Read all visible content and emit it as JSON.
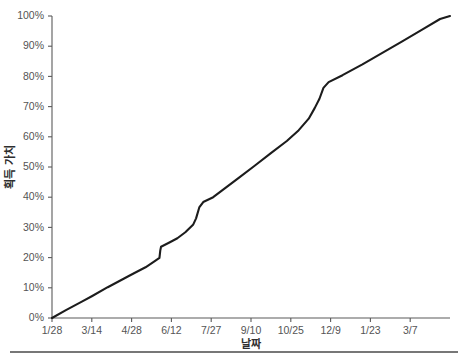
{
  "chart_data": {
    "type": "line",
    "title": "",
    "xlabel": "날짜",
    "ylabel": "획득 가치",
    "grid": false,
    "legend": false,
    "legend_position": "none",
    "line_color": "#1c1c1c",
    "axis_color": "#5a5a5a",
    "background": "#ffffff",
    "xlim": [
      0,
      10
    ],
    "ylim": [
      0,
      100
    ],
    "x_tick_positions": [
      0,
      1,
      2,
      3,
      4,
      5,
      6,
      7,
      8,
      9
    ],
    "categories": [
      "1/28",
      "3/14",
      "4/28",
      "6/12",
      "7/27",
      "9/10",
      "10/25",
      "12/9",
      "1/23",
      "3/7"
    ],
    "y_tick_values": [
      0,
      10,
      20,
      30,
      40,
      50,
      60,
      70,
      80,
      90,
      100
    ],
    "y_tick_labels": [
      "0%",
      "10%",
      "20%",
      "30%",
      "40%",
      "50%",
      "60%",
      "70%",
      "80%",
      "90%",
      "100%"
    ],
    "series": [
      {
        "name": "획득 가치",
        "points": [
          {
            "x": 0.0,
            "y": 0.0
          },
          {
            "x": 0.35,
            "y": 2.6
          },
          {
            "x": 0.75,
            "y": 5.4
          },
          {
            "x": 1.0,
            "y": 7.2
          },
          {
            "x": 1.4,
            "y": 10.2
          },
          {
            "x": 1.8,
            "y": 13.0
          },
          {
            "x": 2.0,
            "y": 14.4
          },
          {
            "x": 2.35,
            "y": 16.8
          },
          {
            "x": 2.6,
            "y": 19.0
          },
          {
            "x": 2.7,
            "y": 19.9
          },
          {
            "x": 2.72,
            "y": 22.3
          },
          {
            "x": 2.74,
            "y": 23.6
          },
          {
            "x": 2.95,
            "y": 25.0
          },
          {
            "x": 3.15,
            "y": 26.4
          },
          {
            "x": 3.35,
            "y": 28.4
          },
          {
            "x": 3.55,
            "y": 31.0
          },
          {
            "x": 3.62,
            "y": 33.0
          },
          {
            "x": 3.7,
            "y": 36.6
          },
          {
            "x": 3.8,
            "y": 38.4
          },
          {
            "x": 4.05,
            "y": 40.0
          },
          {
            "x": 4.3,
            "y": 42.5
          },
          {
            "x": 4.7,
            "y": 46.5
          },
          {
            "x": 5.1,
            "y": 50.5
          },
          {
            "x": 5.5,
            "y": 54.6
          },
          {
            "x": 5.9,
            "y": 58.6
          },
          {
            "x": 6.2,
            "y": 62.2
          },
          {
            "x": 6.45,
            "y": 66.0
          },
          {
            "x": 6.6,
            "y": 69.5
          },
          {
            "x": 6.72,
            "y": 72.6
          },
          {
            "x": 6.82,
            "y": 76.2
          },
          {
            "x": 6.95,
            "y": 78.1
          },
          {
            "x": 7.3,
            "y": 80.4
          },
          {
            "x": 7.8,
            "y": 84.0
          },
          {
            "x": 8.3,
            "y": 87.8
          },
          {
            "x": 8.8,
            "y": 91.6
          },
          {
            "x": 9.3,
            "y": 95.5
          },
          {
            "x": 9.75,
            "y": 99.0
          },
          {
            "x": 10.0,
            "y": 100.0
          }
        ]
      }
    ],
    "annotations": [
      {
        "label": "step jump",
        "x": 2.72,
        "y_from": 22.3,
        "y_to": 23.6
      },
      {
        "label": "steep rise",
        "x": 3.7,
        "y_from": 33.0,
        "y_to": 36.6
      },
      {
        "label": "steep rise",
        "x": 6.82,
        "y_from": 72.6,
        "y_to": 78.1
      }
    ]
  },
  "layout": {
    "plot_left": 52,
    "plot_right": 450,
    "plot_top": 16,
    "plot_bottom": 318,
    "footer_rule_y": 352,
    "footer_rule_left": 10,
    "footer_rule_right": 458
  }
}
